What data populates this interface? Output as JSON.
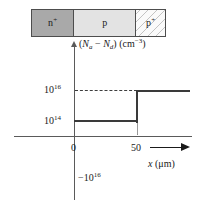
{
  "figure": {
    "device": {
      "regions": [
        {
          "label": "n",
          "superscript": "+",
          "fill": "#a9a9a9",
          "name": "n-plus-region"
        },
        {
          "label": "p",
          "superscript": "",
          "fill": "#e3e3e3",
          "name": "p-region"
        },
        {
          "label": "p",
          "superscript": "+",
          "fill": "#fafafa",
          "name": "p-plus-region"
        }
      ]
    }
  },
  "chart_data": {
    "type": "line",
    "title": "",
    "ylabel": "(Na − Nd) (cm−3)",
    "ylabel_parts": {
      "open": "(",
      "n_a": "N",
      "a_sub": "a",
      "minus": " − ",
      "n_d": "N",
      "d_sub": "d",
      "close": ") (cm",
      "exp": "−3",
      "tail": ")"
    },
    "xlabel": "x (μm)",
    "xlabel_parts": {
      "x": "x",
      "units": " (μm)"
    },
    "x_ticks": [
      "0",
      "50"
    ],
    "x_tick_values": [
      0,
      50
    ],
    "y_ticks": [
      "10",
      "10",
      "−10"
    ],
    "y_tick_labels": [
      {
        "mantissa": "10",
        "exponent": "16",
        "name": "ytick-1e16"
      },
      {
        "mantissa": "10",
        "exponent": "14",
        "name": "ytick-1e14"
      },
      {
        "mantissa": "−10",
        "exponent": "16",
        "name": "ytick-neg-1e16"
      }
    ],
    "grid": false,
    "legend": null,
    "series": [
      {
        "name": "net doping (Na − Nd)",
        "steps": [
          {
            "x_start": -40,
            "x_end": 0,
            "value": -1e+16,
            "label": "−10^16",
            "region": "n+"
          },
          {
            "x_start": 0,
            "x_end": 50,
            "value": 100000000000000.0,
            "label": "10^14",
            "region": "p"
          },
          {
            "x_start": 50,
            "x_end": 95,
            "value": 1e+16,
            "label": "10^16",
            "region": "p+"
          }
        ]
      }
    ],
    "annotations": [
      {
        "type": "dashed-guide",
        "y_label": "10^16",
        "from_x": 0,
        "to_x": 50,
        "name": "dashed-guide-1e16"
      },
      {
        "type": "tick-drop",
        "x": 50,
        "name": "step-tick-x50"
      }
    ],
    "axis_arrows": {
      "x": true,
      "y": true
    }
  },
  "colors": {
    "axis": "#5a5a5a",
    "curve": "#3a3a3a",
    "dashed": "#3d3d3d",
    "arrow": "#1a1a1a",
    "n_plus_fill": "#a9a9a9",
    "p_fill": "#e3e3e3",
    "p_plus_fill": "#fafafa",
    "border": "#4d4d4d"
  }
}
